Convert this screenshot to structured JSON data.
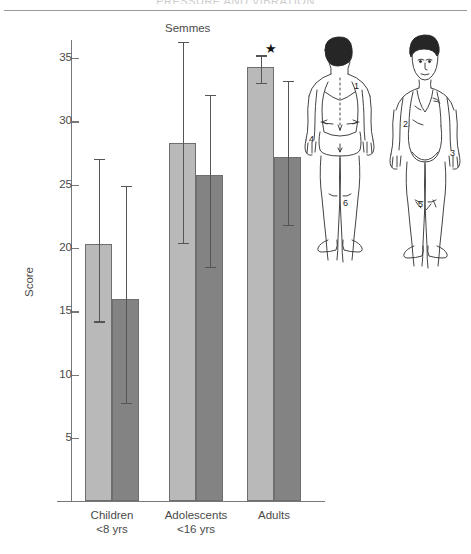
{
  "header": {
    "title": "PRESSURE AND VIBRATION"
  },
  "chart_data": {
    "type": "bar",
    "title": "",
    "subtitle": "",
    "xlabel": "",
    "ylabel": "Score",
    "ylim": [
      0,
      37
    ],
    "yticks": [
      5,
      10,
      15,
      20,
      25,
      30,
      35
    ],
    "grid": false,
    "legend_position": "none",
    "categories": [
      "Children <8 yrs",
      "Adolescents <16 yrs",
      "Adults"
    ],
    "category_lines": [
      [
        "Children",
        "<8 yrs"
      ],
      [
        "Adolescents",
        "<16 yrs"
      ],
      [
        "Adults",
        ""
      ]
    ],
    "series": [
      {
        "name": "light",
        "color": "#b9b9b9",
        "values": [
          20.3,
          28.3,
          34.3
        ],
        "err_high": [
          27.0,
          36.3,
          35.2
        ],
        "err_low": [
          14.2,
          20.4,
          33.0
        ]
      },
      {
        "name": "dark",
        "color": "#838383",
        "values": [
          16.0,
          25.8,
          27.2
        ],
        "err_high": [
          24.9,
          32.1,
          33.2
        ],
        "err_low": [
          7.8,
          18.5,
          21.8
        ]
      }
    ],
    "annotations": [
      {
        "text": "Semmes",
        "x_value": 1.0,
        "y_value": 36.9
      },
      {
        "text": "★",
        "x_value": 2.15,
        "y_value": 35.3
      }
    ]
  },
  "body_diagram": {
    "views": [
      "posterior",
      "anterior"
    ],
    "site_labels": [
      "1",
      "2",
      "3",
      "4",
      "5",
      "6"
    ],
    "posterior_sites": [
      "1",
      "4",
      "6"
    ],
    "anterior_sites": [
      "2",
      "3",
      "5"
    ]
  },
  "colors": {
    "bar_light": "#b9b9b9",
    "bar_dark": "#838383",
    "axis": "#777777",
    "text": "#4a4a4a",
    "error_bar": "#555555"
  }
}
